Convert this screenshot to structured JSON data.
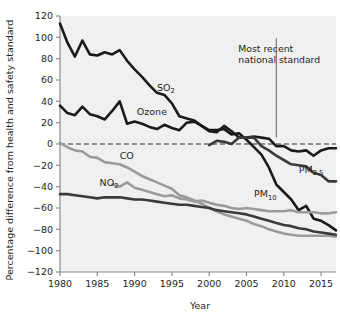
{
  "chart_data": {
    "type": "line",
    "title": "",
    "xlabel": "Year",
    "ylabel": "Percentage difference from health and safety standard",
    "xlim": [
      1980,
      2017
    ],
    "ylim": [
      -120,
      120
    ],
    "xticks": [
      1980,
      1985,
      1990,
      1995,
      2000,
      2005,
      2010,
      2015
    ],
    "yticks": [
      120,
      100,
      80,
      60,
      40,
      20,
      0,
      -20,
      -40,
      -60,
      -80,
      -100,
      -120
    ],
    "grid": false,
    "legend": "inline-labels",
    "zero_reference_line": {
      "value": 0,
      "style": "dashed",
      "label": "health and safety standard"
    },
    "annotations": [
      {
        "text_line1": "Most recent",
        "text_line2": "national standard",
        "leader_x": 2009,
        "leader_y_top": 88,
        "leader_y_bottom": 6
      }
    ],
    "x": [
      1980,
      1981,
      1982,
      1983,
      1984,
      1985,
      1986,
      1987,
      1988,
      1989,
      1990,
      1991,
      1992,
      1993,
      1994,
      1995,
      1996,
      1997,
      1998,
      1999,
      2000,
      2001,
      2002,
      2003,
      2004,
      2005,
      2006,
      2007,
      2008,
      2009,
      2010,
      2011,
      2012,
      2013,
      2014,
      2015,
      2016,
      2017
    ],
    "series": [
      {
        "name": "SO2",
        "label": "SO",
        "sub": "2",
        "color": "#1a1a1a",
        "width": 2.6,
        "label_x": 1993.0,
        "label_y": 50,
        "values": [
          113,
          95,
          82,
          97,
          84,
          83,
          86,
          84,
          88,
          78,
          70,
          63,
          55,
          48,
          46,
          38,
          26,
          24,
          22,
          17,
          13,
          13,
          14,
          9,
          10,
          4,
          -3,
          -10,
          -22,
          -38,
          -45,
          -52,
          -62,
          -58,
          -70,
          -72,
          -76,
          -81
        ]
      },
      {
        "name": "Ozone",
        "label": "Ozone",
        "sub": "",
        "color": "#1a1a1a",
        "width": 2.6,
        "label_x": 1990.3,
        "label_y": 27,
        "values": [
          36,
          29,
          27,
          35,
          28,
          26,
          23,
          31,
          40,
          19,
          21,
          19,
          16,
          14,
          18,
          15,
          13,
          20,
          21,
          17,
          12,
          11,
          17,
          12,
          6,
          6,
          7,
          6,
          5,
          -2,
          -2,
          -6,
          -7,
          -6,
          -11,
          -6,
          -4,
          -4
        ]
      },
      {
        "name": "CO",
        "label": "CO",
        "sub": "",
        "color": "#9b9b9b",
        "width": 2.6,
        "label_x": 1988.0,
        "label_y": -14,
        "values": [
          1,
          -3,
          -6,
          -7,
          -12,
          -13,
          -17,
          -18,
          -19,
          -22,
          -26,
          -30,
          -33,
          -36,
          -39,
          -42,
          -48,
          -50,
          -53,
          -56,
          -60,
          -63,
          -66,
          -68,
          -70,
          -72,
          -75,
          -77,
          -80,
          -82,
          -84,
          -85,
          -86,
          -86,
          -86,
          -86,
          -86,
          -87
        ]
      },
      {
        "name": "NO2",
        "label": "NO",
        "sub": "2",
        "color": "#3a3a3a",
        "width": 2.6,
        "label_x": 1985.3,
        "label_y": -39,
        "values": [
          -47,
          -47,
          -48,
          -49,
          -50,
          -51,
          -50,
          -50,
          -50,
          -51,
          -52,
          -52,
          -53,
          -54,
          -55,
          -56,
          -57,
          -57,
          -58,
          -59,
          -60,
          -62,
          -63,
          -64,
          -65,
          -66,
          -68,
          -70,
          -72,
          -74,
          -76,
          -77,
          -79,
          -80,
          -82,
          -83,
          -84,
          -85
        ]
      },
      {
        "name": "PM10",
        "label": "PM",
        "sub": "10",
        "color": "#9b9b9b",
        "width": 2.6,
        "label_x": 2006.0,
        "label_y": -50,
        "values": [
          null,
          null,
          null,
          null,
          null,
          null,
          null,
          -38,
          -40,
          -36,
          -41,
          -43,
          -45,
          -47,
          -49,
          -48,
          -51,
          -52,
          -54,
          -53,
          -55,
          -57,
          -58,
          -60,
          -61,
          -60,
          -61,
          -62,
          -63,
          -63,
          -63,
          -62,
          -64,
          -64,
          -64,
          -65,
          -65,
          -64
        ]
      },
      {
        "name": "PM2.5",
        "label": "PM",
        "sub": "2.5",
        "color": "#3a3a3a",
        "width": 2.6,
        "label_x": 2012.0,
        "label_y": -27,
        "values": [
          null,
          null,
          null,
          null,
          null,
          null,
          null,
          null,
          null,
          null,
          null,
          null,
          null,
          null,
          null,
          null,
          null,
          null,
          null,
          null,
          -1,
          3,
          2,
          0,
          6,
          6,
          6,
          -2,
          -6,
          -11,
          -15,
          -19,
          -20,
          -21,
          -27,
          -29,
          -35,
          -35
        ]
      }
    ]
  }
}
